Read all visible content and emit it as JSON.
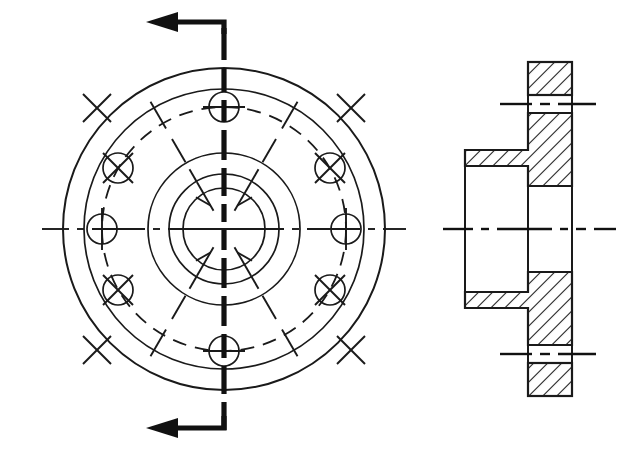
{
  "document": {
    "title": "Flange — Front View and Full Section",
    "background_color": "#ffffff",
    "line_color": "#1a1a1a",
    "width": 637,
    "height": 455
  },
  "front_view": {
    "name": "front-view",
    "center": {
      "x": 224,
      "y": 229
    },
    "circles": [
      {
        "name": "outer-flange-circle",
        "radius": 161,
        "style": "solid"
      },
      {
        "name": "flange-face-circle",
        "radius": 140,
        "style": "solid"
      },
      {
        "name": "bolt-circle",
        "radius": 122,
        "style": "hidden-dashed"
      },
      {
        "name": "hub-outer-circle",
        "radius": 76,
        "style": "solid"
      },
      {
        "name": "hub-inner-circle",
        "radius": 55,
        "style": "solid"
      },
      {
        "name": "bore-circle",
        "radius": 41,
        "style": "solid"
      }
    ],
    "bolt_holes": {
      "count": 6,
      "hole_radius": 15,
      "bolt_circle_radius": 122,
      "angles_deg": [
        90,
        150,
        210,
        270,
        330,
        30
      ],
      "positions": [
        {
          "label": "top",
          "angle_deg": 90,
          "x": 224,
          "y": 107
        },
        {
          "label": "upper-left",
          "angle_deg": 150,
          "x": 118,
          "y": 168
        },
        {
          "label": "lower-left",
          "angle_deg": 210,
          "x": 118,
          "y": 290
        },
        {
          "label": "bottom",
          "angle_deg": 270,
          "x": 224,
          "y": 351
        },
        {
          "label": "lower-right",
          "angle_deg": 330,
          "x": 330,
          "y": 290
        },
        {
          "label": "upper-right",
          "angle_deg": 30,
          "x": 330,
          "y": 168
        }
      ]
    },
    "radial_centerlines": {
      "name": "radial-center-ticks",
      "angles_deg": [
        0,
        60,
        120,
        180,
        240,
        300
      ],
      "description": "centerline ticks crossing each circle at 60 degree intervals"
    },
    "horizontal_centerline": {
      "x1": 42,
      "x2": 406,
      "y": 229
    }
  },
  "cutting_plane": {
    "name": "cutting-plane-line",
    "label": "",
    "x": 224,
    "y_top": 28,
    "y_bottom": 430,
    "style": "heavy-dash-dot",
    "arrows": [
      {
        "name": "cut-arrow-top",
        "direction": "left",
        "elbow_x": 224,
        "y": 22,
        "tip_x": 160
      },
      {
        "name": "cut-arrow-bottom",
        "direction": "left",
        "elbow_x": 224,
        "y": 428,
        "tip_x": 160
      }
    ]
  },
  "section_view": {
    "name": "section-view",
    "centerline_y": 229,
    "centerline": {
      "x1": 443,
      "x2": 616,
      "y": 229
    },
    "flange_plate": {
      "x_left": 528,
      "x_right": 572,
      "y_top": 62,
      "y_bottom": 396
    },
    "hub": {
      "x_left": 465,
      "x_right": 528,
      "y_top": 150,
      "y_bottom": 308
    },
    "bore": {
      "x_left": 465,
      "x_right": 572,
      "y_top": 186,
      "y_bottom": 272
    },
    "counterbore": {
      "x_left": 465,
      "x_right": 528,
      "y_top": 166,
      "y_bottom": 292
    },
    "bolt_holes": [
      {
        "name": "upper-bolt-hole",
        "y_top": 95,
        "y_bottom": 113,
        "centerline_y": 104,
        "x_left": 528,
        "x_right": 572
      },
      {
        "name": "lower-bolt-hole",
        "y_top": 345,
        "y_bottom": 363,
        "centerline_y": 354,
        "x_left": 528,
        "x_right": 572
      }
    ],
    "bolt_hole_centerlines": [
      {
        "name": "upper-bolt-centerline",
        "x1": 500,
        "x2": 596,
        "y": 104
      },
      {
        "name": "lower-bolt-centerline",
        "x1": 500,
        "x2": 596,
        "y": 354
      }
    ],
    "hatching": {
      "name": "section-hatch",
      "angle_deg": 45,
      "spacing": 7,
      "description": "45 degree section hatching on cut material"
    }
  }
}
